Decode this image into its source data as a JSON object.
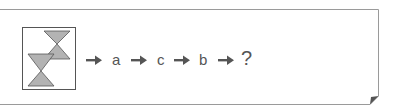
{
  "puzzle": {
    "start_figure": {
      "description": "two overlapping hourglass shapes",
      "icon": "hourglass-pair-icon",
      "fill_color": "#b3b3b3",
      "stroke_color": "#555555"
    },
    "sequence": [
      {
        "arrow": "right-arrow-icon",
        "label": "a"
      },
      {
        "arrow": "right-arrow-icon",
        "label": "c"
      },
      {
        "arrow": "right-arrow-icon",
        "label": "b"
      },
      {
        "arrow": "right-arrow-icon",
        "label": "?"
      }
    ],
    "colors": {
      "frame": "#9a9a9a",
      "arrow": "#555555",
      "text": "#555555",
      "corner_fold": "#555555"
    }
  }
}
